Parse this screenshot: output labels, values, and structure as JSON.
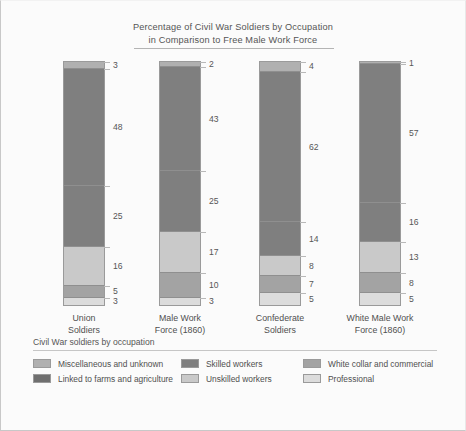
{
  "chart_data": {
    "type": "bar",
    "subtype": "stacked-100-percent",
    "title": "Percentage of Civil War Soldiers by Occupation in Comparison to Free Male Work Force",
    "title_lines": [
      "Percentage of Civil War Soldiers by Occupation",
      "in Comparison to Free Male Work Force"
    ],
    "xlabel": "",
    "ylabel": "",
    "ylim": [
      0,
      100
    ],
    "grid": false,
    "legend_position": "bottom",
    "legend_title": "Civil War soldiers by occupation",
    "categories": [
      "Union Soldiers",
      "Male Work Force (1860)",
      "Confederate Soldiers",
      "White Male Work Force (1860)"
    ],
    "category_lines": [
      [
        "Union",
        "Soldiers"
      ],
      [
        "Male Work",
        "Force (1860)"
      ],
      [
        "Confederate",
        "Soldiers"
      ],
      [
        "White Male Work",
        "Force (1860)"
      ]
    ],
    "stack_order_top_to_bottom": [
      "Miscellaneous and unknown",
      "Linked to farms and agriculture",
      "Skilled workers",
      "Unskilled workers",
      "White collar and commercial",
      "Professional"
    ],
    "series": [
      {
        "name": "Miscellaneous and unknown",
        "color": "#b0b0b0",
        "values": [
          3,
          2,
          4,
          1
        ]
      },
      {
        "name": "Linked to farms and agriculture",
        "color": "#7f7f7f",
        "values": [
          48,
          43,
          62,
          57
        ]
      },
      {
        "name": "Skilled workers",
        "color": "#7f7f7f",
        "values": [
          25,
          25,
          14,
          16
        ]
      },
      {
        "name": "Unskilled workers",
        "color": "#c9c9c9",
        "values": [
          16,
          17,
          8,
          13
        ]
      },
      {
        "name": "White collar and commercial",
        "color": "#a3a3a3",
        "values": [
          5,
          10,
          7,
          8
        ]
      },
      {
        "name": "Professional",
        "color": "#dcdcdc",
        "values": [
          3,
          3,
          5,
          5
        ]
      }
    ],
    "bars": [
      {
        "category": "Union Soldiers",
        "segments": [
          {
            "label": "Miscellaneous and unknown",
            "value": 3,
            "display": "3",
            "color": "#b0b0b0"
          },
          {
            "label": "Linked to farms and agriculture",
            "value": 48,
            "display": "48",
            "color": "#7f7f7f"
          },
          {
            "label": "Skilled workers",
            "value": 25,
            "display": "25",
            "color": "#7f7f7f"
          },
          {
            "label": "Unskilled workers",
            "value": 16,
            "display": "16",
            "color": "#c9c9c9"
          },
          {
            "label": "White collar and commercial",
            "value": 5,
            "display": "5",
            "color": "#a3a3a3"
          },
          {
            "label": "Professional",
            "value": 3,
            "display": "3",
            "color": "#dcdcdc"
          }
        ]
      },
      {
        "category": "Male Work Force (1860)",
        "segments": [
          {
            "label": "Miscellaneous and unknown",
            "value": 2,
            "display": "2",
            "color": "#b0b0b0"
          },
          {
            "label": "Linked to farms and agriculture",
            "value": 43,
            "display": "43",
            "color": "#7f7f7f"
          },
          {
            "label": "Skilled workers",
            "value": 25,
            "display": "25",
            "color": "#7f7f7f"
          },
          {
            "label": "Unskilled workers",
            "value": 17,
            "display": "17",
            "color": "#c9c9c9"
          },
          {
            "label": "White collar and commercial",
            "value": 10,
            "display": "10",
            "color": "#a3a3a3"
          },
          {
            "label": "Professional",
            "value": 3,
            "display": "3",
            "color": "#dcdcdc"
          }
        ]
      },
      {
        "category": "Confederate Soldiers",
        "segments": [
          {
            "label": "Miscellaneous and unknown",
            "value": 4,
            "display": "4",
            "color": "#b0b0b0"
          },
          {
            "label": "Linked to farms and agriculture",
            "value": 62,
            "display": "62",
            "color": "#7f7f7f"
          },
          {
            "label": "Skilled workers",
            "value": 14,
            "display": "14",
            "color": "#7f7f7f"
          },
          {
            "label": "Unskilled workers",
            "value": 8,
            "display": "8",
            "color": "#c9c9c9"
          },
          {
            "label": "White collar and commercial",
            "value": 7,
            "display": "7",
            "color": "#a3a3a3"
          },
          {
            "label": "Professional",
            "value": 5,
            "display": "5",
            "color": "#dcdcdc"
          }
        ]
      },
      {
        "category": "White Male Work Force (1860)",
        "segments": [
          {
            "label": "Miscellaneous and unknown",
            "value": 1,
            "display": "1",
            "color": "#b0b0b0"
          },
          {
            "label": "Linked to farms and agriculture",
            "value": 57,
            "display": "57",
            "color": "#7f7f7f"
          },
          {
            "label": "Skilled workers",
            "value": 16,
            "display": "16",
            "color": "#7f7f7f"
          },
          {
            "label": "Unskilled workers",
            "value": 13,
            "display": "13",
            "color": "#c9c9c9"
          },
          {
            "label": "White collar and commercial",
            "value": 8,
            "display": "8",
            "color": "#a3a3a3"
          },
          {
            "label": "Professional",
            "value": 5,
            "display": "5",
            "color": "#dcdcdc"
          }
        ]
      }
    ],
    "legend_entries": [
      {
        "label": "Miscellaneous and unknown",
        "color": "#b0b0b0"
      },
      {
        "label": "Skilled workers",
        "color": "#7f7f7f"
      },
      {
        "label": "White collar and commercial",
        "color": "#a3a3a3"
      },
      {
        "label": "Linked to farms and agriculture",
        "color": "#6f6f6f"
      },
      {
        "label": "Unskilled workers",
        "color": "#c9c9c9"
      },
      {
        "label": "Professional",
        "color": "#dcdcdc"
      }
    ]
  }
}
